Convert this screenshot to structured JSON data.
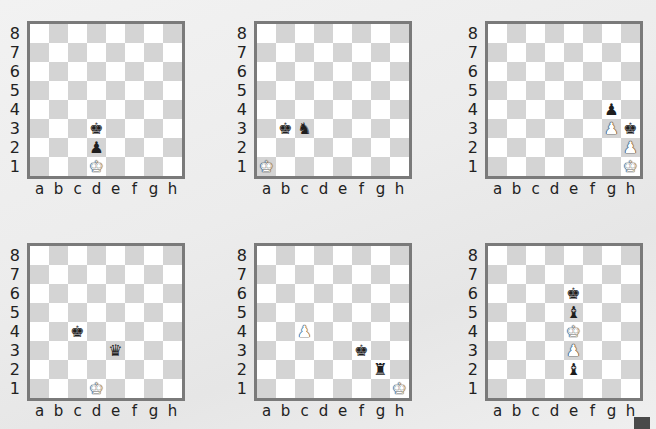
{
  "files": [
    "a",
    "b",
    "c",
    "d",
    "e",
    "f",
    "g",
    "h"
  ],
  "ranks": [
    "8",
    "7",
    "6",
    "5",
    "4",
    "3",
    "2",
    "1"
  ],
  "piece_glyphs": {
    "K": "♚",
    "Q": "♛",
    "R": "♜",
    "B": "♝",
    "N": "♞",
    "P": "♟"
  },
  "colors": {
    "light_square": "#ffffff",
    "dark_square": "#d4d4d4",
    "frame": "#7a7a7a"
  },
  "diagrams": [
    {
      "pos": [
        0,
        0
      ],
      "pieces": [
        {
          "sq": "d3",
          "type": "K",
          "color": "black"
        },
        {
          "sq": "d2",
          "type": "P",
          "color": "black"
        },
        {
          "sq": "d1",
          "type": "K",
          "color": "white"
        }
      ]
    },
    {
      "pos": [
        227,
        0
      ],
      "pieces": [
        {
          "sq": "b3",
          "type": "K",
          "color": "black"
        },
        {
          "sq": "c3",
          "type": "N",
          "color": "black"
        },
        {
          "sq": "a1",
          "type": "K",
          "color": "white"
        }
      ]
    },
    {
      "pos": [
        458,
        0
      ],
      "pieces": [
        {
          "sq": "g4",
          "type": "P",
          "color": "black"
        },
        {
          "sq": "g3",
          "type": "P",
          "color": "white"
        },
        {
          "sq": "h3",
          "type": "K",
          "color": "black"
        },
        {
          "sq": "h2",
          "type": "P",
          "color": "white"
        },
        {
          "sq": "h1",
          "type": "K",
          "color": "white"
        }
      ]
    },
    {
      "pos": [
        0,
        222
      ],
      "pieces": [
        {
          "sq": "c4",
          "type": "K",
          "color": "black"
        },
        {
          "sq": "e3",
          "type": "Q",
          "color": "black"
        },
        {
          "sq": "d1",
          "type": "K",
          "color": "white"
        }
      ]
    },
    {
      "pos": [
        227,
        222
      ],
      "pieces": [
        {
          "sq": "c4",
          "type": "P",
          "color": "white"
        },
        {
          "sq": "f3",
          "type": "K",
          "color": "black"
        },
        {
          "sq": "g2",
          "type": "R",
          "color": "black"
        },
        {
          "sq": "h1",
          "type": "K",
          "color": "white"
        }
      ]
    },
    {
      "pos": [
        458,
        222
      ],
      "pieces": [
        {
          "sq": "e6",
          "type": "K",
          "color": "black"
        },
        {
          "sq": "e5",
          "type": "B",
          "color": "black"
        },
        {
          "sq": "e4",
          "type": "K",
          "color": "white"
        },
        {
          "sq": "e3",
          "type": "P",
          "color": "white"
        },
        {
          "sq": "e2",
          "type": "B",
          "color": "black"
        }
      ]
    }
  ]
}
